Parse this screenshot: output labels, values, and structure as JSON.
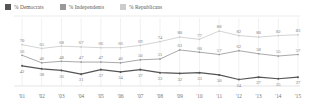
{
  "legend": {
    "items": [
      {
        "label": "% Democrats",
        "color": "#555555",
        "icon": "square-swatch"
      },
      {
        "label": "% Independents",
        "color": "#999999",
        "icon": "square-swatch"
      },
      {
        "label": "% Republicans",
        "color": "#cccccc",
        "icon": "square-swatch"
      }
    ]
  },
  "chart_data": {
    "type": "line",
    "title": "",
    "subtitle": "",
    "xlabel": "",
    "ylabel": "",
    "ylim": [
      0,
      100
    ],
    "grid": true,
    "legend_position": "top-left",
    "categories": [
      "'01",
      "'02",
      "'03",
      "'04",
      "'05",
      "'06",
      "'07",
      "'08",
      "'09",
      "'10",
      "'11",
      "'12",
      "'13",
      "'14",
      "'15"
    ],
    "series": [
      {
        "name": "% Republicans",
        "color": "#cccccc",
        "values": [
          70,
          65,
          68,
          67,
          66,
          66,
          69,
          74,
          80,
          77,
          88,
          82,
          80,
          82,
          83
        ]
      },
      {
        "name": "% Independents",
        "color": "#999999",
        "values": [
          56,
          46,
          48,
          47,
          47,
          46,
          50,
          51,
          63,
          60,
          57,
          62,
          58,
          55,
          57
        ]
      },
      {
        "name": "% Democrats",
        "color": "#555555",
        "values": [
          42,
          38,
          36,
          31,
          37,
          34,
          37,
          33,
          32,
          33,
          30,
          24,
          27,
          25,
          27
        ]
      }
    ]
  }
}
